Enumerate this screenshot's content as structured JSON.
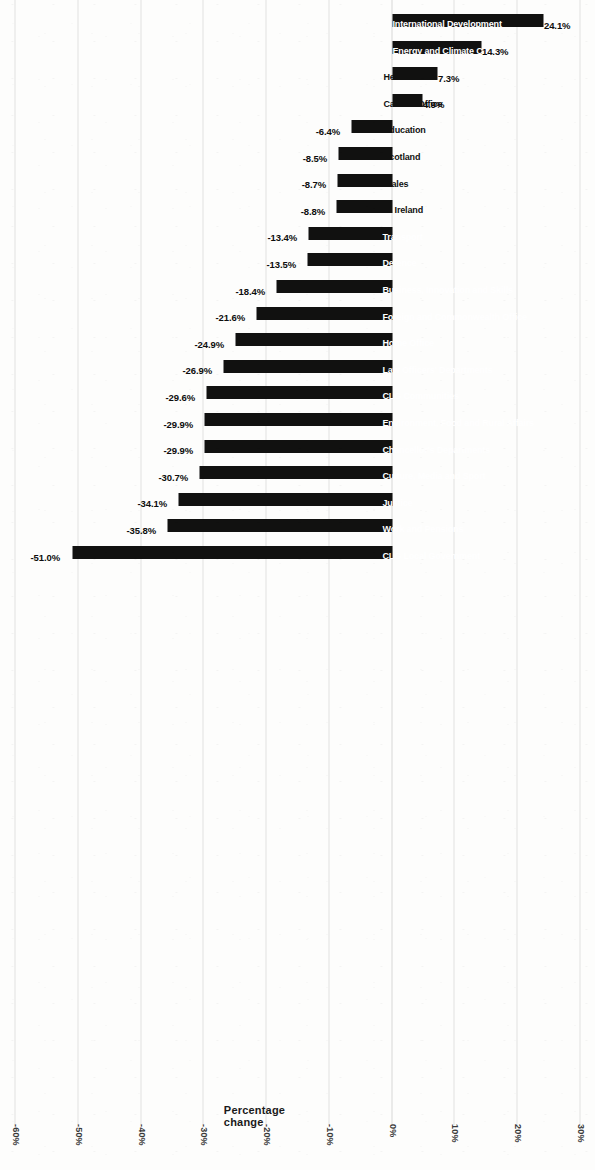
{
  "chart_data": {
    "type": "bar",
    "title": "",
    "subtitle": "",
    "xlabel": "",
    "ylabel": "Percentage change",
    "orientation": "vertical-bars-on-rotated-page",
    "grid": true,
    "legend": "none",
    "ylim": [
      -60,
      30
    ],
    "ytick_labels": [
      "30%",
      "20%",
      "10%",
      "0%",
      "-10%",
      "-20%",
      "-30%",
      "-40%",
      "-50%",
      "-60%"
    ],
    "ytick_values": [
      30,
      20,
      10,
      0,
      -10,
      -20,
      -30,
      -40,
      -50,
      -60
    ],
    "bar_color": "#111110",
    "categories": [
      "International Development",
      "Energy and Climate Change",
      "Health",
      "Cabinet Office",
      "Education",
      "Scotland",
      "Wales",
      "N. Ireland",
      "Transport",
      "Defence",
      "Business, Innovation and Skills",
      "Foreign and Commonwealth Office",
      "Home Office",
      "Law Officers' Departments",
      "CLG Communities",
      "Environment, Food and Rural Affairs",
      "Chancellor's Departments",
      "Culture, Media and Sport",
      "Justice",
      "Work and Pensions",
      "CLG Local Government"
    ],
    "values": [
      24.1,
      14.3,
      7.3,
      4.9,
      -6.4,
      -8.5,
      -8.7,
      -8.8,
      -13.4,
      -13.5,
      -18.4,
      -21.6,
      -24.9,
      -26.9,
      -29.6,
      -29.9,
      -29.9,
      -30.7,
      -34.1,
      -35.8,
      -51.0
    ],
    "data_labels": [
      "24.1%",
      "14.3%",
      "7.3%",
      "4.9%",
      "-6.4%",
      "-8.5%",
      "-8.7%",
      "-8.8%",
      "-13.4%",
      "-13.5%",
      "-18.4%",
      "-21.6%",
      "-24.9%",
      "-26.9%",
      "-29.6%",
      "-29.9%",
      "-29.9%",
      "-30.7%",
      "-34.1%",
      "-35.8%",
      "-51.0%"
    ]
  }
}
